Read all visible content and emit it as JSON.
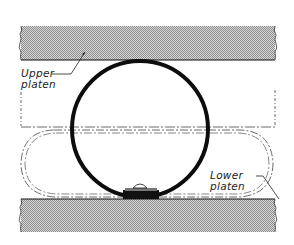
{
  "figure": {
    "colors": {
      "platen_fill": "#bdbdbd",
      "outline": "#111111",
      "ring": "#0d0d0d",
      "phantom": "#444444"
    }
  },
  "labels": {
    "upper_platen": [
      "Upper",
      "platen"
    ],
    "lower_platen": [
      "Lower",
      "platen"
    ]
  }
}
